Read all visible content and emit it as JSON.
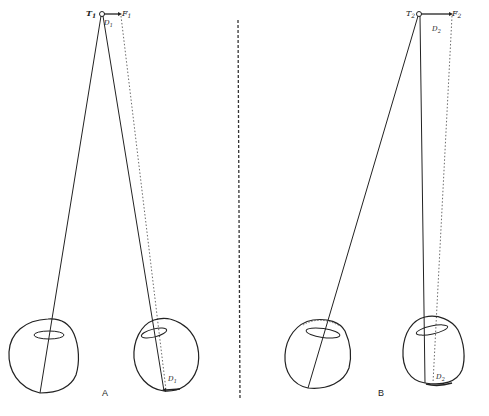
{
  "diagram": {
    "panels": [
      {
        "id": "A",
        "label": "A",
        "target_label": "T",
        "target_sub": "1",
        "fixation_label": "F",
        "fixation_sub": "1",
        "disparity_top_label": "D",
        "disparity_top_sub": "1",
        "disparity_retina_label": "D",
        "disparity_retina_sub": "1"
      },
      {
        "id": "B",
        "label": "B",
        "target_label": "T",
        "target_sub": "2",
        "fixation_label": "F",
        "fixation_sub": "2",
        "disparity_top_label": "D",
        "disparity_top_sub": "2",
        "disparity_retina_label": "D",
        "disparity_retina_sub": "2"
      }
    ],
    "divider": "dashed-vertical",
    "colors": {
      "ink": "#222222",
      "background": "#ffffff"
    }
  }
}
